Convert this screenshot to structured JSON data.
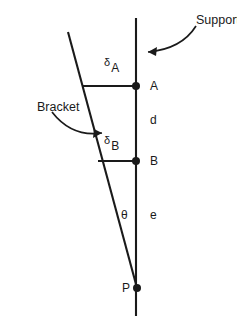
{
  "figure": {
    "type": "engineering-diagram",
    "width": 237,
    "height": 330,
    "background_color": "#ffffff",
    "line_color": "#1a1a1a",
    "text_color": "#1a1a1a"
  },
  "callouts": [
    {
      "key": "support",
      "label": "Support",
      "text_x": 196,
      "text_y": 14,
      "arrow_path": "M 196 26 C 186 42 170 50 148 52",
      "arrow_tip": "M 148 52 L 157 47 L 156 56 Z"
    },
    {
      "key": "bracket",
      "label": "Bracket",
      "text_x": 37,
      "text_y": 101,
      "arrow_path": "M 52 112 C 66 130 82 136 102 133",
      "arrow_tip": "M 102 133 L 93 138 L 94 129 Z"
    }
  ],
  "lines": {
    "support": {
      "name": "support-line",
      "x1": 136,
      "y1": 18,
      "x2": 136,
      "y2": 316
    },
    "bracket": {
      "name": "bracket-line",
      "x1": 68,
      "y1": 32,
      "x2": 137,
      "y2": 288
    },
    "deflection_a": {
      "name": "deflection-line-a",
      "x1": 82,
      "y1": 86,
      "x2": 136,
      "y2": 86
    },
    "deflection_b": {
      "name": "deflection-line-b",
      "x1": 98,
      "y1": 161,
      "x2": 136,
      "y2": 161
    }
  },
  "points": [
    {
      "key": "A",
      "label": "A",
      "x": 136,
      "y": 86,
      "label_x": 150,
      "label_y": 80,
      "radius": 4
    },
    {
      "key": "B",
      "label": "B",
      "x": 136,
      "y": 161,
      "label_x": 150,
      "label_y": 155,
      "radius": 4
    },
    {
      "key": "P",
      "label": "P",
      "x": 137,
      "y": 288,
      "label_x": 122,
      "label_y": 282,
      "radius": 4
    }
  ],
  "annotations": {
    "delta_a": {
      "symbol": "δ",
      "subscript": "A",
      "x": 104,
      "y": 57
    },
    "delta_b": {
      "symbol": "δ",
      "subscript": "B",
      "x": 104,
      "y": 135
    },
    "theta": {
      "label": "θ",
      "x": 121,
      "y": 209
    },
    "d": {
      "label": "d",
      "x": 150,
      "y": 114
    },
    "e": {
      "label": "e",
      "x": 150,
      "y": 209
    }
  }
}
